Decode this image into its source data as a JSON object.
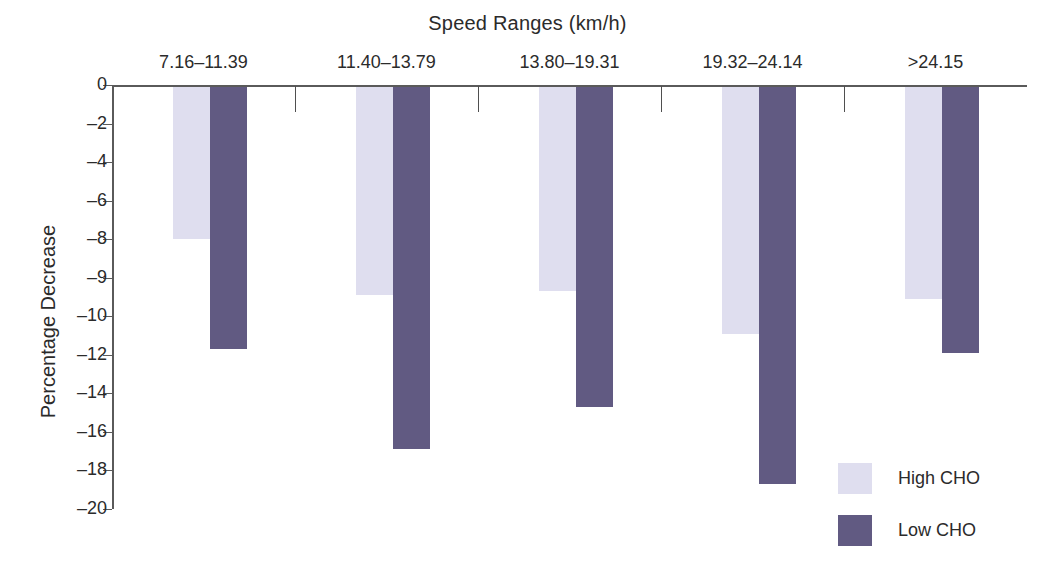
{
  "chart_data": {
    "type": "bar",
    "title": "Speed Ranges (km/h)",
    "xlabel": "Speed Ranges (km/h)",
    "ylabel": "Percentage Decrease",
    "categories": [
      "7.16–11.39",
      "11.40–13.79",
      "13.80–19.31",
      "19.32–24.14",
      ">24.15"
    ],
    "series": [
      {
        "name": "High CHO",
        "color": "#dfdeef",
        "values": [
          -7.9,
          -9.4,
          -9.3,
          -10.8,
          -9.5
        ]
      },
      {
        "name": "Low CHO",
        "color": "#615a82",
        "values": [
          -11.6,
          -16.8,
          -14.6,
          -18.6,
          -11.8
        ]
      }
    ],
    "ytick_labels": [
      "0",
      "–2",
      "–4",
      "–6",
      "–8",
      "–9",
      "–10",
      "–12",
      "–14",
      "–16",
      "–18",
      "–20"
    ],
    "ytick_values": [
      0,
      -2,
      -4,
      -6,
      -8,
      -9,
      -10,
      -12,
      -14,
      -16,
      -18,
      -20
    ],
    "ylim": [
      -20,
      0
    ],
    "grid": false,
    "legend_position": "bottom-right",
    "orientation": "downward-bars"
  },
  "legend": {
    "items": [
      {
        "label": "High CHO",
        "swatch": "high"
      },
      {
        "label": "Low CHO",
        "swatch": "low"
      }
    ]
  }
}
